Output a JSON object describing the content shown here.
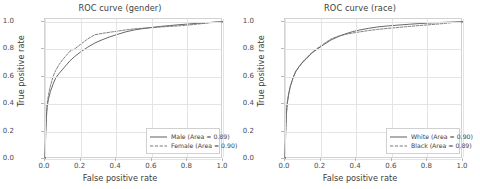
{
  "figure": {
    "panels": [
      {
        "name": "gender",
        "title": "ROC curve (gender)",
        "xlabel": "False positive rate",
        "ylabel": "True positive rate",
        "xticks": [
          "0.0",
          "0.2",
          "0.4",
          "0.6",
          "0.8",
          "1.0"
        ],
        "yticks": [
          "0.0",
          "0.2",
          "0.4",
          "0.6",
          "0.8",
          "1.0"
        ],
        "legend": [
          {
            "label": "Male (Area = 0.89)",
            "style": "solid"
          },
          {
            "label": "Female (Area = 0.90)",
            "style": "dashed"
          }
        ]
      },
      {
        "name": "race",
        "title": "ROC curve (race)",
        "xlabel": "False positive rate",
        "ylabel": "True positive rate",
        "xticks": [
          "0.0",
          "0.2",
          "0.4",
          "0.6",
          "0.8",
          "1.0"
        ],
        "yticks": [
          "0.0",
          "0.2",
          "0.4",
          "0.6",
          "0.8",
          "1.0"
        ],
        "legend": [
          {
            "label": "White (Area = 0.90)",
            "style": "solid"
          },
          {
            "label": "Black (Area = 0.89)",
            "style": "dashed"
          }
        ]
      }
    ]
  },
  "chart_data": [
    {
      "type": "line",
      "title": "ROC curve (gender)",
      "xlabel": "False positive rate",
      "ylabel": "True positive rate",
      "xlim": [
        0.0,
        1.0
      ],
      "ylim": [
        0.0,
        1.02
      ],
      "grid": true,
      "legend_position": "lower right",
      "series": [
        {
          "name": "Male (Area = 0.89)",
          "style": "solid",
          "color": "#4d4d4d",
          "auc": 0.89,
          "x": [
            0.0,
            0.004,
            0.008,
            0.012,
            0.02,
            0.03,
            0.045,
            0.06,
            0.08,
            0.1,
            0.12,
            0.14,
            0.17,
            0.2,
            0.24,
            0.28,
            0.32,
            0.36,
            0.4,
            0.45,
            0.5,
            0.55,
            0.6,
            0.65,
            0.7,
            0.75,
            0.8,
            0.85,
            0.9,
            0.95,
            1.0
          ],
          "y": [
            0.0,
            0.18,
            0.3,
            0.38,
            0.44,
            0.49,
            0.545,
            0.59,
            0.625,
            0.655,
            0.685,
            0.715,
            0.75,
            0.78,
            0.815,
            0.845,
            0.868,
            0.888,
            0.905,
            0.925,
            0.94,
            0.95,
            0.958,
            0.966,
            0.972,
            0.978,
            0.983,
            0.988,
            0.992,
            0.997,
            1.0
          ]
        },
        {
          "name": "Female (Area = 0.90)",
          "style": "dashed",
          "color": "#6a6a6a",
          "auc": 0.9,
          "x": [
            0.0,
            0.004,
            0.008,
            0.012,
            0.02,
            0.03,
            0.045,
            0.06,
            0.08,
            0.1,
            0.12,
            0.14,
            0.17,
            0.2,
            0.24,
            0.28,
            0.32,
            0.36,
            0.4,
            0.45,
            0.5,
            0.55,
            0.6,
            0.65,
            0.7,
            0.75,
            0.8,
            0.85,
            0.9,
            0.95,
            1.0
          ],
          "y": [
            0.0,
            0.2,
            0.33,
            0.4,
            0.47,
            0.53,
            0.6,
            0.645,
            0.69,
            0.725,
            0.755,
            0.785,
            0.805,
            0.835,
            0.875,
            0.905,
            0.915,
            0.923,
            0.93,
            0.94,
            0.948,
            0.953,
            0.958,
            0.962,
            0.966,
            0.97,
            0.975,
            0.982,
            0.989,
            0.996,
            1.0
          ]
        }
      ]
    },
    {
      "type": "line",
      "title": "ROC curve (race)",
      "xlabel": "False positive rate",
      "ylabel": "True positive rate",
      "xlim": [
        0.0,
        1.0
      ],
      "ylim": [
        0.0,
        1.02
      ],
      "grid": true,
      "legend_position": "lower right",
      "series": [
        {
          "name": "White (Area = 0.90)",
          "style": "solid",
          "color": "#4d4d4d",
          "auc": 0.9,
          "x": [
            0.0,
            0.004,
            0.008,
            0.012,
            0.02,
            0.03,
            0.045,
            0.06,
            0.08,
            0.1,
            0.12,
            0.15,
            0.18,
            0.22,
            0.26,
            0.3,
            0.34,
            0.38,
            0.42,
            0.47,
            0.52,
            0.58,
            0.64,
            0.7,
            0.76,
            0.82,
            0.88,
            0.94,
            1.0
          ],
          "y": [
            0.0,
            0.2,
            0.33,
            0.4,
            0.47,
            0.53,
            0.59,
            0.635,
            0.675,
            0.705,
            0.73,
            0.77,
            0.8,
            0.835,
            0.868,
            0.892,
            0.912,
            0.928,
            0.94,
            0.952,
            0.962,
            0.97,
            0.976,
            0.982,
            0.987,
            0.991,
            0.995,
            0.998,
            1.0
          ]
        },
        {
          "name": "Black (Area = 0.89)",
          "style": "dashed",
          "color": "#6a6a6a",
          "auc": 0.89,
          "x": [
            0.0,
            0.004,
            0.008,
            0.012,
            0.02,
            0.03,
            0.045,
            0.06,
            0.08,
            0.1,
            0.12,
            0.15,
            0.18,
            0.22,
            0.26,
            0.3,
            0.34,
            0.38,
            0.42,
            0.47,
            0.52,
            0.58,
            0.64,
            0.7,
            0.76,
            0.82,
            0.88,
            0.94,
            1.0
          ],
          "y": [
            0.0,
            0.2,
            0.33,
            0.4,
            0.47,
            0.53,
            0.59,
            0.64,
            0.675,
            0.71,
            0.735,
            0.775,
            0.805,
            0.842,
            0.875,
            0.895,
            0.908,
            0.918,
            0.926,
            0.936,
            0.944,
            0.952,
            0.959,
            0.966,
            0.973,
            0.979,
            0.986,
            0.994,
            1.0
          ]
        }
      ]
    }
  ]
}
